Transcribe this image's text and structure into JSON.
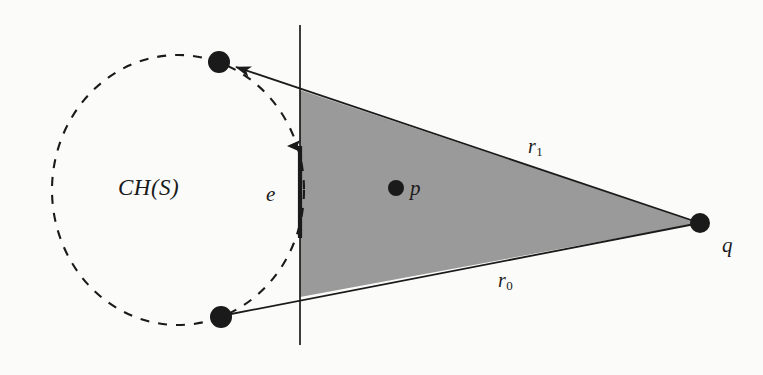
{
  "figure": {
    "kind": "computational-geometry-diagram",
    "background_color": "#fbfbfa",
    "ink_color": "#1a1a1a",
    "wedge_fill_color": "#9a9a9a",
    "width": 763,
    "height": 375,
    "labels": {
      "convex_hull": "CH(S)",
      "edge": "e",
      "point_p": "p",
      "point_q": "q",
      "ray_upper_base": "r",
      "ray_upper_sub": "1",
      "ray_lower_base": "r",
      "ray_lower_sub": "0"
    },
    "geometry": {
      "hull_ellipse": {
        "cx": 178,
        "cy": 190,
        "rx": 126,
        "ry": 135,
        "dash": "9 9"
      },
      "vertical_line": {
        "x": 300,
        "y1": 25,
        "y2": 345
      },
      "edge_arrow": {
        "x": 300,
        "y_tail": 238,
        "y_head": 138
      },
      "apex_q": {
        "x": 700,
        "y": 223,
        "r": 10
      },
      "vertex_top": {
        "x": 219,
        "y": 62,
        "r": 11
      },
      "vertex_bottom": {
        "x": 221,
        "y": 317,
        "r": 11
      },
      "point_p": {
        "x": 396,
        "y": 188,
        "r": 8
      },
      "wedge_polygon": "300,90 700,223 300,297",
      "upper_ray": "700,223 219,62",
      "lower_ray": "700,223 221,317"
    },
    "label_positions": {
      "convex_hull": {
        "x": 118,
        "y": 176
      },
      "edge": {
        "x": 266,
        "y": 184
      },
      "point_p": {
        "x": 410,
        "y": 178
      },
      "point_q": {
        "x": 722,
        "y": 235
      },
      "ray_upper": {
        "x": 528,
        "y": 136
      },
      "ray_lower": {
        "x": 498,
        "y": 270
      }
    }
  }
}
